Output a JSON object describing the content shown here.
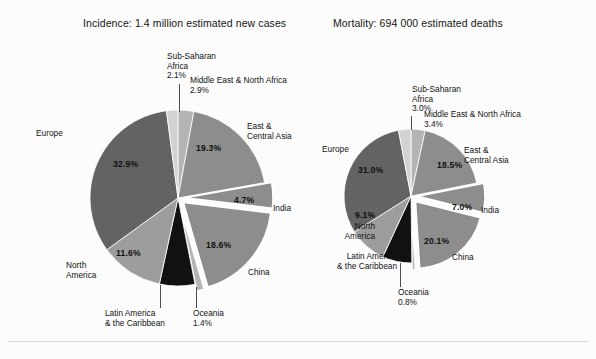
{
  "figure": {
    "background": "#fcfcfc",
    "rule_color": "#d7d7d7",
    "palette": {
      "sub_saharan_africa": "#d2d2d2",
      "middle_east_north_africa": "#b4b4b4",
      "east_central_asia": "#8d8d8d",
      "india": "#8d8d8d",
      "china": "#8d8d8d",
      "oceania": "#b4b4b4",
      "latin_america_caribbean": "#111111",
      "north_america": "#9d9d9d",
      "europe": "#636363",
      "slice_edge": "#ffffff"
    }
  },
  "charts": [
    {
      "id": "incidence",
      "title": "Incidence: 1.4 million estimated new cases",
      "center": [
        178,
        198
      ],
      "radius": 88,
      "labels": {
        "sub_saharan_africa": "Sub-Saharan\nAfrica\n2.1%",
        "middle_east_north_africa": "Middle East & North Africa\n2.9%",
        "east_central_asia": "East &\nCentral Asia",
        "india": "India",
        "china": "China",
        "oceania": "Oceania\n1.4%",
        "latin_america_caribbean": "Latin America\n& the Caribbean",
        "north_america": "North\nAmerica",
        "europe": "Europe"
      },
      "inner_pcts": {
        "east_central_asia": "19.3%",
        "india": "4.7%",
        "china": "18.6%",
        "north_america": "11.6%",
        "europe": "32.9%"
      }
    },
    {
      "id": "mortality",
      "title": "Mortality: 694 000 estimated deaths",
      "center": [
        411,
        196
      ],
      "radius": 67,
      "labels": {
        "sub_saharan_africa": "Sub-Saharan\nAfrica\n3.0%",
        "middle_east_north_africa": "Middle East & North Africa\n3.4%",
        "east_central_asia": "East &\nCentral Asia",
        "india": "India",
        "china": "China",
        "oceania": "Oceania\n0.8%",
        "latin_america_caribbean": "Latin America\n& the Caribbean",
        "north_america": "North\nAmerica",
        "europe": "Europe"
      },
      "inner_pcts": {
        "east_central_asia": "18.5%",
        "india": "7.0%",
        "china": "20.1%",
        "north_america": "9.1%",
        "europe": "31.0%"
      }
    }
  ],
  "chart_data": [
    {
      "type": "pie",
      "id": "incidence",
      "title": "Incidence: 1.4 million estimated new cases",
      "total_label": "1.4 million estimated new cases",
      "start_angle_deg": 0,
      "direction": "clockwise",
      "categories": [
        "Middle East & North Africa",
        "East & Central Asia",
        "India",
        "China",
        "Oceania",
        "Latin America & the Caribbean",
        "North America",
        "Europe",
        "Sub-Saharan Africa"
      ],
      "values": [
        2.9,
        19.3,
        4.7,
        18.6,
        1.4,
        6.5,
        11.6,
        32.9,
        2.1
      ],
      "unit": "%",
      "exploded": [
        "India",
        "China",
        "Oceania"
      ],
      "colors": [
        "#b4b4b4",
        "#8d8d8d",
        "#8d8d8d",
        "#8d8d8d",
        "#b4b4b4",
        "#111111",
        "#9d9d9d",
        "#636363",
        "#d2d2d2"
      ],
      "legend": "none",
      "labels_shown_inside": [
        "19.3%",
        "4.7%",
        "18.6%",
        "11.6%",
        "32.9%"
      ],
      "labels_shown_outside": [
        "Sub-Saharan Africa 2.1%",
        "Middle East & North Africa 2.9%",
        "East & Central Asia",
        "India",
        "China",
        "Oceania 1.4%",
        "Latin America & the Caribbean",
        "North America",
        "Europe"
      ]
    },
    {
      "type": "pie",
      "id": "mortality",
      "title": "Mortality: 694 000 estimated deaths",
      "total_label": "694 000 estimated deaths",
      "start_angle_deg": 0,
      "direction": "clockwise",
      "categories": [
        "Middle East & North Africa",
        "East & Central Asia",
        "India",
        "China",
        "Oceania",
        "Latin America & the Caribbean",
        "North America",
        "Europe",
        "Sub-Saharan Africa"
      ],
      "values": [
        3.4,
        18.5,
        7.0,
        20.1,
        0.8,
        7.1,
        9.1,
        31.0,
        3.0
      ],
      "unit": "%",
      "exploded": [
        "India",
        "China",
        "Oceania"
      ],
      "colors": [
        "#b4b4b4",
        "#8d8d8d",
        "#8d8d8d",
        "#8d8d8d",
        "#b4b4b4",
        "#111111",
        "#9d9d9d",
        "#636363",
        "#d2d2d2"
      ],
      "legend": "none",
      "labels_shown_inside": [
        "18.5%",
        "7.0%",
        "20.1%",
        "9.1%",
        "31.0%"
      ],
      "labels_shown_outside": [
        "Sub-Saharan Africa 3.0%",
        "Middle East & North Africa 3.4%",
        "East & Central Asia",
        "India",
        "China",
        "Oceania 0.8%",
        "Latin America & the Caribbean",
        "North America",
        "Europe"
      ]
    }
  ]
}
